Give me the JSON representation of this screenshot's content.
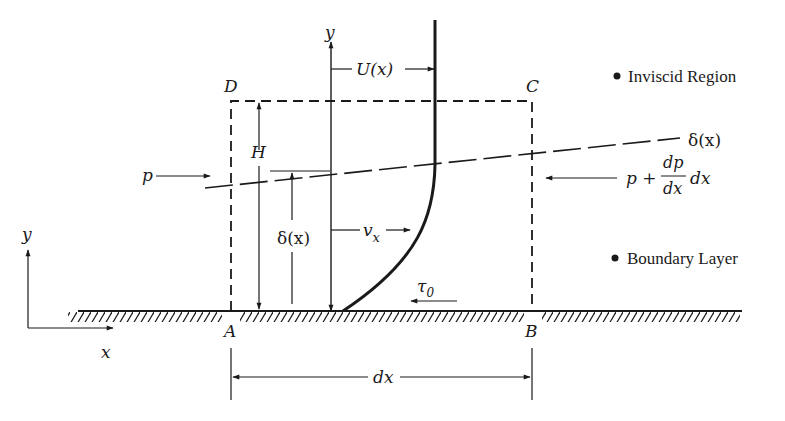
{
  "diagram": {
    "legend": {
      "inviscid": "Inviscid Region",
      "boundary": "Boundary Layer"
    },
    "corners": {
      "A": "A",
      "B": "B",
      "C": "C",
      "D": "D"
    },
    "labels": {
      "y_axis_center": "y",
      "U": "U(x)",
      "delta_line": "δ(x)",
      "H": "H",
      "delta_dim": "δ(x)",
      "vx_v": "v",
      "vx_sub": "x",
      "tau_t": "τ",
      "tau_sub": "0",
      "p_left": "p",
      "p_right_p": "p +",
      "p_right_num": "dp",
      "p_right_den": "dx",
      "p_right_dx": "dx",
      "dx_dim": "dx",
      "coord_y": "y",
      "coord_x": "x"
    },
    "colors": {
      "ink": "#1a1a1a",
      "background": "#ffffff"
    }
  }
}
